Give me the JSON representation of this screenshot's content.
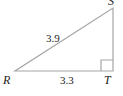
{
  "diagram": {
    "type": "right-triangle",
    "vertices": {
      "R": {
        "label": "R"
      },
      "S": {
        "label": "S"
      },
      "T": {
        "label": "T"
      }
    },
    "sides": {
      "RS": {
        "length_label": "3.9"
      },
      "RT": {
        "length_label": "3.3"
      }
    },
    "right_angle_at": "T",
    "colors": {
      "stroke": "#a6a6a6",
      "text": "#222222"
    }
  }
}
